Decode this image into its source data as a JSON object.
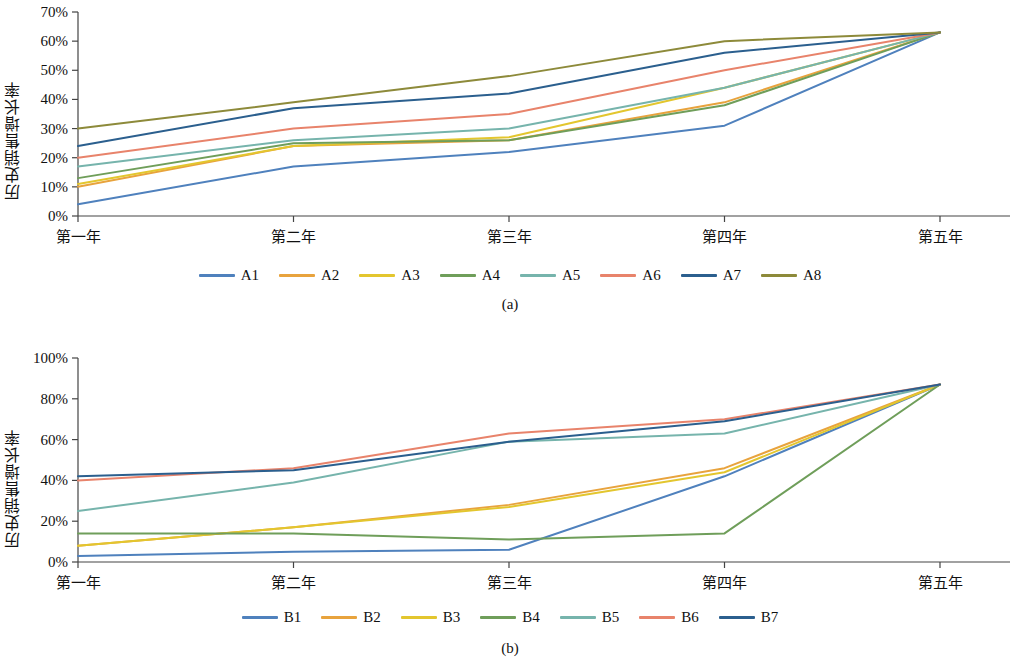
{
  "figure": {
    "ylabel": "历史销售增长率",
    "caption_a": "(a)",
    "caption_b": "(b)"
  },
  "chart_data": [
    {
      "type": "line",
      "title": "",
      "subtitle": "(a)",
      "xlabel": "",
      "ylabel": "历史销售增长率",
      "categories": [
        "第一年",
        "第二年",
        "第三年",
        "第四年",
        "第五年"
      ],
      "ytick_labels": [
        "0%",
        "10%",
        "20%",
        "30%",
        "40%",
        "50%",
        "60%",
        "70%"
      ],
      "ylim": [
        0,
        70
      ],
      "ytick_step": 10,
      "grid": false,
      "legend_position": "bottom",
      "series": [
        {
          "name": "A1",
          "color": "#4f81bd",
          "values": [
            4,
            17,
            22,
            31,
            63
          ]
        },
        {
          "name": "A2",
          "color": "#e8a33d",
          "values": [
            10,
            24,
            26,
            39,
            63
          ]
        },
        {
          "name": "A3",
          "color": "#e3c62e",
          "values": [
            11,
            24,
            27,
            44,
            63
          ]
        },
        {
          "name": "A4",
          "color": "#6f9e5a",
          "values": [
            13,
            25,
            26,
            38,
            63
          ]
        },
        {
          "name": "A5",
          "color": "#76b4ac",
          "values": [
            17,
            26,
            30,
            44,
            63
          ]
        },
        {
          "name": "A6",
          "color": "#e8836b",
          "values": [
            20,
            30,
            35,
            50,
            63
          ]
        },
        {
          "name": "A7",
          "color": "#2b5f8e",
          "values": [
            24,
            37,
            42,
            56,
            63
          ]
        },
        {
          "name": "A8",
          "color": "#8d8a3a",
          "values": [
            30,
            39,
            48,
            60,
            63
          ]
        }
      ]
    },
    {
      "type": "line",
      "title": "",
      "subtitle": "(b)",
      "xlabel": "",
      "ylabel": "历史销售增长率",
      "categories": [
        "第一年",
        "第二年",
        "第三年",
        "第四年",
        "第五年"
      ],
      "ytick_labels": [
        "0%",
        "20%",
        "40%",
        "60%",
        "80%",
        "100%"
      ],
      "ylim": [
        0,
        100
      ],
      "ytick_step": 20,
      "grid": false,
      "legend_position": "bottom",
      "series": [
        {
          "name": "B1",
          "color": "#4f81bd",
          "values": [
            3,
            5,
            6,
            42,
            87
          ]
        },
        {
          "name": "B2",
          "color": "#e8a33d",
          "values": [
            8,
            17,
            28,
            46,
            87
          ]
        },
        {
          "name": "B3",
          "color": "#e3c62e",
          "values": [
            8,
            17,
            27,
            44,
            87
          ]
        },
        {
          "name": "B4",
          "color": "#6f9e5a",
          "values": [
            14,
            14,
            11,
            14,
            87
          ]
        },
        {
          "name": "B5",
          "color": "#76b4ac",
          "values": [
            25,
            39,
            59,
            63,
            87
          ]
        },
        {
          "name": "B6",
          "color": "#e8836b",
          "values": [
            40,
            46,
            63,
            70,
            87
          ]
        },
        {
          "name": "B7",
          "color": "#2b5f8e",
          "values": [
            42,
            45,
            59,
            69,
            87
          ]
        }
      ]
    }
  ],
  "legend_a": {
    "items": [
      {
        "label": "A1",
        "color": "#4f81bd"
      },
      {
        "label": "A2",
        "color": "#e8a33d"
      },
      {
        "label": "A3",
        "color": "#e3c62e"
      },
      {
        "label": "A4",
        "color": "#6f9e5a"
      },
      {
        "label": "A5",
        "color": "#76b4ac"
      },
      {
        "label": "A6",
        "color": "#e8836b"
      },
      {
        "label": "A7",
        "color": "#2b5f8e"
      },
      {
        "label": "A8",
        "color": "#8d8a3a"
      }
    ]
  },
  "legend_b": {
    "items": [
      {
        "label": "B1",
        "color": "#4f81bd"
      },
      {
        "label": "B2",
        "color": "#e8a33d"
      },
      {
        "label": "B3",
        "color": "#e3c62e"
      },
      {
        "label": "B4",
        "color": "#6f9e5a"
      },
      {
        "label": "B5",
        "color": "#76b4ac"
      },
      {
        "label": "B6",
        "color": "#e8836b"
      },
      {
        "label": "B7",
        "color": "#2b5f8e"
      }
    ]
  }
}
